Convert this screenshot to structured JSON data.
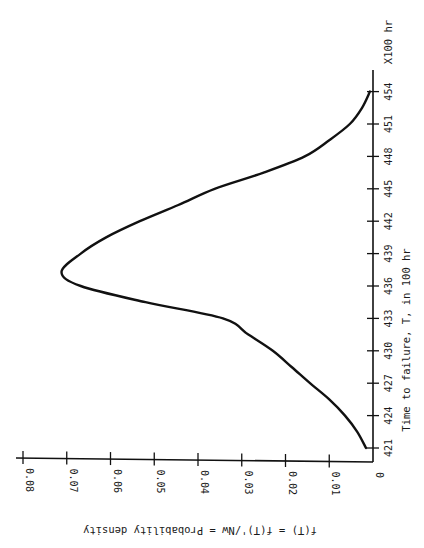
{
  "chart_data": {
    "type": "line",
    "title": "",
    "orientation": "rotated-90-clockwise",
    "xlabel": "Time to failure, T, in 100 hr",
    "x_unit_label": "X100 hr",
    "ylabel": "f(T) = f(T)'/Nw = Probability density",
    "xlim": [
      421,
      455
    ],
    "ylim": [
      0,
      0.08
    ],
    "x_ticks": [
      "421",
      "424",
      "427",
      "430",
      "433",
      "436",
      "439",
      "442",
      "445",
      "448",
      "451",
      "454"
    ],
    "y_ticks": [
      "0",
      "0.01",
      "0.02",
      "0.03",
      "0.04",
      "0.05",
      "0.06",
      "0.07",
      "0.08"
    ],
    "grid": false,
    "legend": "none",
    "series": [
      {
        "name": "Probability density f(T)",
        "x": [
          421,
          422.5,
          424,
          425.5,
          427,
          428.5,
          430,
          431.5,
          433,
          434.5,
          436,
          437.3,
          439,
          440.5,
          442,
          443.5,
          445,
          446.5,
          448,
          449.5,
          451,
          452.5,
          454
        ],
        "y": [
          0.0016,
          0.0036,
          0.0064,
          0.01,
          0.0144,
          0.0186,
          0.0229,
          0.0285,
          0.0343,
          0.052,
          0.0668,
          0.0712,
          0.0668,
          0.061,
          0.0533,
          0.0445,
          0.0362,
          0.025,
          0.0156,
          0.01,
          0.0053,
          0.0025,
          0.0007
        ]
      }
    ]
  }
}
